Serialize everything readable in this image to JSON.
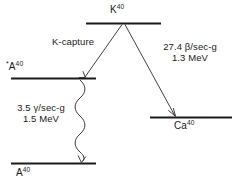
{
  "diagram": {
    "kind": "nuclear-decay-scheme",
    "background_color": "#ffffff",
    "line_color": "#1a1a1a",
    "levels": [
      {
        "id": "k40",
        "symbol": "K",
        "mass_number": "40",
        "label": "K40",
        "role": "parent-nucleus"
      },
      {
        "id": "a40-excited",
        "symbol": "A",
        "mass_number": "40",
        "prefix": "*",
        "label": "*A40",
        "role": "excited-daughter"
      },
      {
        "id": "a40-ground",
        "symbol": "A",
        "mass_number": "40",
        "label": "A40",
        "role": "ground-state-daughter"
      },
      {
        "id": "ca40",
        "symbol": "Ca",
        "mass_number": "40",
        "label": "Ca40",
        "role": "beta-daughter"
      }
    ],
    "transitions": [
      {
        "id": "k-capture",
        "label": "K-capture",
        "from": "k40",
        "to": "a40-excited",
        "style": "straight-arrow"
      },
      {
        "id": "beta-decay",
        "from": "k40",
        "to": "ca40",
        "style": "straight-arrow",
        "rate": "27.4 β/sec-g",
        "rate_value": "27.4",
        "rate_particle": "β",
        "rate_units": "/sec-g",
        "energy": "1.3 MeV",
        "energy_value": "1.3",
        "energy_units": "MeV"
      },
      {
        "id": "gamma-emission",
        "from": "a40-excited",
        "to": "a40-ground",
        "style": "wavy-arrow",
        "rate": "3.5 γ/sec-g",
        "rate_value": "3.5",
        "rate_particle": "γ",
        "rate_units": "/sec-g",
        "energy": "1.5 MeV",
        "energy_value": "1.5",
        "energy_units": "MeV"
      }
    ]
  }
}
